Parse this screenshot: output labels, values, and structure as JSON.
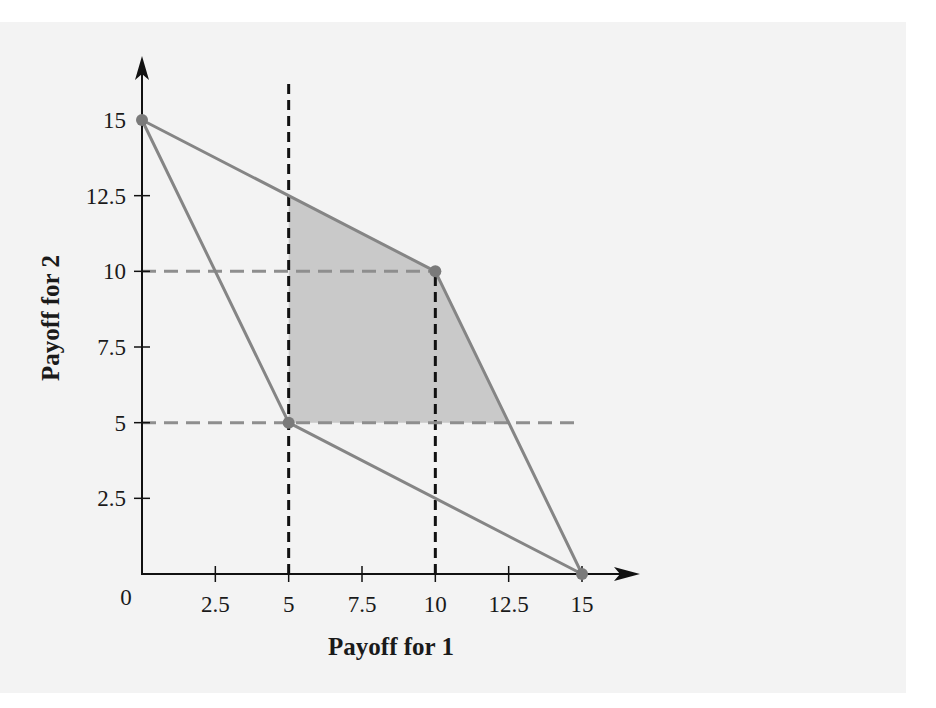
{
  "chart_data": {
    "type": "line",
    "title": "",
    "xlabel": "Payoff for 1",
    "ylabel": "Payoff for 2",
    "xlim": [
      0,
      15
    ],
    "ylim": [
      0,
      15
    ],
    "origin_label": "0",
    "x_ticks": [
      {
        "value": 2.5,
        "label": "2.5"
      },
      {
        "value": 5,
        "label": "5"
      },
      {
        "value": 7.5,
        "label": "7.5"
      },
      {
        "value": 10,
        "label": "10"
      },
      {
        "value": 12.5,
        "label": "12.5"
      },
      {
        "value": 15,
        "label": "15"
      }
    ],
    "y_ticks": [
      {
        "value": 2.5,
        "label": "2.5"
      },
      {
        "value": 5,
        "label": "5"
      },
      {
        "value": 7.5,
        "label": "7.5"
      },
      {
        "value": 10,
        "label": "10"
      },
      {
        "value": 12.5,
        "label": "12.5"
      },
      {
        "value": 15,
        "label": "15"
      }
    ],
    "grid": false,
    "feasible_region_edges": [
      {
        "name": "edge-0-15-to-10-10",
        "from": [
          0,
          15
        ],
        "to": [
          10,
          10
        ]
      },
      {
        "name": "edge-10-10-to-15-0",
        "from": [
          10,
          10
        ],
        "to": [
          15,
          0
        ]
      },
      {
        "name": "edge-0-15-to-5-5",
        "from": [
          0,
          15
        ],
        "to": [
          5,
          5
        ]
      },
      {
        "name": "edge-5-5-to-15-0",
        "from": [
          5,
          5
        ],
        "to": [
          15,
          0
        ]
      }
    ],
    "payoff_points": [
      {
        "name": "point-0-15",
        "x": 0,
        "y": 15
      },
      {
        "name": "point-10-10",
        "x": 10,
        "y": 10
      },
      {
        "name": "point-5-5",
        "x": 5,
        "y": 5
      },
      {
        "name": "point-15-0",
        "x": 15,
        "y": 0
      }
    ],
    "shaded_region": [
      [
        5,
        5
      ],
      [
        5,
        12.5
      ],
      [
        10,
        10
      ],
      [
        12.5,
        5
      ]
    ],
    "reference_lines": [
      {
        "name": "vline-x-5",
        "orientation": "vertical",
        "value": 5,
        "from": 0,
        "to": 16,
        "style": "black-dashed"
      },
      {
        "name": "vline-x-10",
        "orientation": "vertical",
        "value": 10,
        "from": 0,
        "to": 10,
        "style": "black-dashed"
      },
      {
        "name": "hline-y-10",
        "orientation": "horizontal",
        "value": 10,
        "from": 0,
        "to": 10,
        "style": "gray-dashed"
      },
      {
        "name": "hline-y-5",
        "orientation": "horizontal",
        "value": 5,
        "from": 0,
        "to": 15,
        "style": "gray-dashed"
      }
    ],
    "colors": {
      "edge": "#858585",
      "point": "#7a7a7a",
      "shade": "#c9c9c9",
      "black_dash": "#111111",
      "gray_dash": "#8e8e8e",
      "axis": "#111111"
    }
  }
}
